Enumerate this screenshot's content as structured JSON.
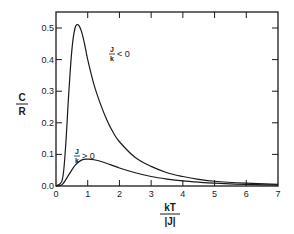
{
  "chart_data": {
    "type": "line",
    "title": "",
    "xlabel": "kT/|J|",
    "xlabel_numerator": "kT",
    "xlabel_denominator": "|J|",
    "ylabel": "C/R",
    "ylabel_numerator": "C",
    "ylabel_denominator": "R",
    "xlim": [
      0,
      7
    ],
    "ylim": [
      0,
      0.52
    ],
    "x_ticks": [
      "0",
      "1",
      "2",
      "3",
      "4",
      "5",
      "6",
      "7"
    ],
    "y_ticks": [
      "0.0",
      "0.1",
      "0.2",
      "0.3",
      "0.4",
      "0.5"
    ],
    "grid": false,
    "legend_position": "none (inline annotations)",
    "series": [
      {
        "name": "J/k < 0",
        "annotation_numerator": "J",
        "annotation_denominator": "k",
        "annotation_relation": "< 0",
        "x": [
          0,
          0.2,
          0.3,
          0.4,
          0.5,
          0.6,
          0.7,
          0.8,
          0.9,
          1.0,
          1.2,
          1.4,
          1.6,
          1.8,
          2.0,
          2.5,
          3.0,
          3.5,
          4.0,
          4.5,
          5.0,
          6.0,
          7.0
        ],
        "y": [
          0,
          0.02,
          0.12,
          0.29,
          0.43,
          0.5,
          0.51,
          0.49,
          0.45,
          0.4,
          0.32,
          0.26,
          0.21,
          0.17,
          0.14,
          0.09,
          0.062,
          0.042,
          0.03,
          0.021,
          0.015,
          0.009,
          0.005
        ]
      },
      {
        "name": "J/k > 0",
        "annotation_numerator": "J",
        "annotation_denominator": "k",
        "annotation_relation": "> 0",
        "x": [
          0,
          0.2,
          0.4,
          0.6,
          0.8,
          1.0,
          1.2,
          1.5,
          2.0,
          2.5,
          3.0,
          3.5,
          4.0,
          4.5,
          5.0,
          6.0,
          7.0
        ],
        "y": [
          0,
          0.005,
          0.035,
          0.065,
          0.082,
          0.085,
          0.083,
          0.075,
          0.057,
          0.042,
          0.03,
          0.022,
          0.016,
          0.012,
          0.009,
          0.005,
          0.003
        ]
      }
    ]
  }
}
